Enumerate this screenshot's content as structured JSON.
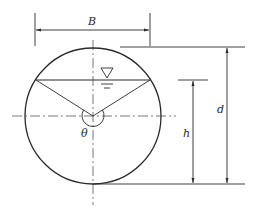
{
  "diagram": {
    "labels": {
      "width": "B",
      "diameter": "d",
      "depth": "h",
      "angle": "θ"
    },
    "symbols": {
      "free_surface": "water-surface-triangle-icon"
    },
    "colors": {
      "stroke": "#2a2a2a",
      "centerline": "#555555",
      "background": "#ffffff"
    }
  }
}
